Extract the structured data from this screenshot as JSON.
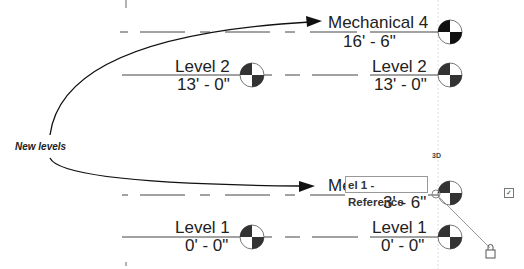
{
  "callout": {
    "label": "New levels"
  },
  "levels": [
    {
      "name": "Mechanical 4",
      "elevation": "16' - 6\""
    },
    {
      "name": "Level 2",
      "elevation": "13' - 0\""
    },
    {
      "name": "Level 2",
      "elevation": "13' - 0\""
    },
    {
      "name": "Mec",
      "elevation": "3' - 6\""
    },
    {
      "name": "Level 1",
      "elevation": "0' - 0\""
    },
    {
      "name": "Level 1",
      "elevation": "0' - 0\""
    }
  ],
  "edit_box": {
    "value": "el 1 - Reference"
  },
  "view_label": "3D",
  "checkbox": {
    "glyph": "✓",
    "checked": true
  },
  "colors": {
    "line": "#222222",
    "dash": "#444444",
    "head_fill": "#222222",
    "leader": "#999999"
  }
}
